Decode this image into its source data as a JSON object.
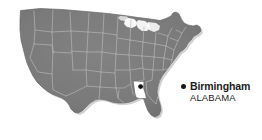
{
  "figure": {
    "type": "locator-map",
    "background_color": "#ffffff"
  },
  "map": {
    "land_fill": "#787878",
    "land_shadow": "#5e5e5e",
    "state_border_color": "#b9b9b9",
    "outline_color": "#6a6a6a",
    "highlight_state": "Alabama",
    "highlight_fill": "#ffffff",
    "highlight_border": "#5a5a5a"
  },
  "marker": {
    "name": "Birmingham",
    "dot_color": "#111111",
    "x": 141,
    "y": 87
  },
  "callout": {
    "bullet_icon": "bullet-dot",
    "bullet_color": "#1a1a1a",
    "city": "Birmingham",
    "state": "ALABAMA",
    "text_color": "#1c1c1c"
  }
}
